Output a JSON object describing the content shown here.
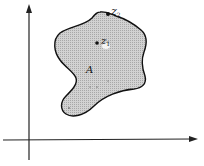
{
  "diagram": {
    "type": "region-in-plane",
    "axes": {
      "horizontal": {
        "direction": "right",
        "arrow": true
      },
      "vertical": {
        "direction": "up",
        "arrow": true
      }
    },
    "region": {
      "label": "A",
      "fill": "#c8c8c8",
      "stroke": "#111111",
      "description": "closed irregular shaded region"
    },
    "points": [
      {
        "id": "z1",
        "label": "z",
        "subscript": "1",
        "location": "interior"
      },
      {
        "id": "z2",
        "label": "z",
        "subscript": "2",
        "location": "boundary"
      }
    ],
    "colors": {
      "axis": "#222222",
      "region_fill": "#c8c8c8",
      "outline": "#111111"
    }
  }
}
